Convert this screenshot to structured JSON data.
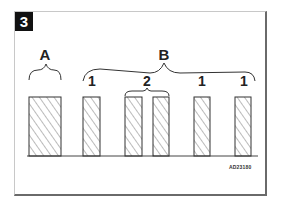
{
  "figure": {
    "number": "3",
    "reference_code": "AD23180"
  },
  "labels": {
    "group_a": "A",
    "group_b": "B",
    "sub_1a": "1",
    "sub_2": "2",
    "sub_1b": "1",
    "sub_1c": "1"
  },
  "bars": [
    {
      "id": "A",
      "x": 29,
      "width": 32
    },
    {
      "id": "B1-first",
      "x": 83,
      "width": 17
    },
    {
      "id": "B2-left",
      "x": 125,
      "width": 17
    },
    {
      "id": "B2-right",
      "x": 153,
      "width": 16
    },
    {
      "id": "B1-second",
      "x": 194,
      "width": 16
    },
    {
      "id": "B1-third",
      "x": 235,
      "width": 16
    }
  ],
  "colors": {
    "stroke": "#333333",
    "frame_shadow": "#6a6a6a",
    "badge_bg": "#111111"
  }
}
